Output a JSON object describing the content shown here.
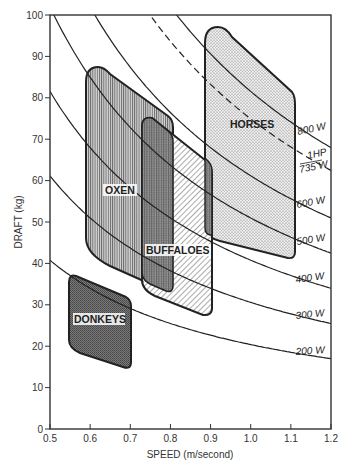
{
  "chart_data": {
    "type": "line",
    "title": "",
    "xlabel": "SPEED (m/second)",
    "ylabel": "DRAFT (kg)",
    "xlim": [
      0.5,
      1.2
    ],
    "ylim": [
      0,
      100
    ],
    "x_ticks": [
      "0.5",
      "0.6",
      "0.7",
      "0.8",
      "0.9",
      "1.0",
      "1.1",
      "1.2"
    ],
    "y_ticks": [
      "0",
      "10",
      "20",
      "30",
      "40",
      "50",
      "60",
      "70",
      "80",
      "90",
      "100"
    ],
    "grid": false,
    "power_curves": [
      {
        "name": "200 W",
        "watts": 200,
        "style": "solid"
      },
      {
        "name": "300 W",
        "watts": 300,
        "style": "solid"
      },
      {
        "name": "400 W",
        "watts": 400,
        "style": "solid"
      },
      {
        "name": "500 W",
        "watts": 500,
        "style": "solid"
      },
      {
        "name": "600 W",
        "watts": 600,
        "style": "solid"
      },
      {
        "name": "1HP / 735 W",
        "watts": 735,
        "style": "dashed"
      },
      {
        "name": "800 W",
        "watts": 800,
        "style": "solid"
      }
    ],
    "regions": [
      {
        "name": "DONKEYS",
        "speed_range": [
          0.55,
          0.71
        ],
        "draft_range": [
          15,
          37
        ],
        "pattern": "dark-stipple"
      },
      {
        "name": "OXEN",
        "speed_range": [
          0.59,
          0.81
        ],
        "draft_range": [
          34,
          87
        ],
        "pattern": "vertical-lines"
      },
      {
        "name": "BUFFALOES",
        "speed_range": [
          0.73,
          0.91
        ],
        "draft_range": [
          28,
          75
        ],
        "pattern": "diagonal-lines"
      },
      {
        "name": "HORSES",
        "speed_range": [
          0.89,
          1.11
        ],
        "draft_range": [
          42,
          97
        ],
        "pattern": "light-stipple"
      }
    ]
  },
  "labels": {
    "xlabel": "SPEED (m/second)",
    "ylabel": "DRAFT (kg)",
    "curve_200": "200 W",
    "curve_300": "300 W",
    "curve_400": "400 W",
    "curve_500": "500 W",
    "curve_600": "600 W",
    "curve_hp_top": "1HP",
    "curve_hp_bottom": "735 W",
    "curve_800": "800 W",
    "donkeys": "DONKEYS",
    "oxen": "OXEN",
    "buffaloes": "BUFFALOES",
    "horses": "HORSES"
  },
  "x_ticks": [
    "0.5",
    "0.6",
    "0.7",
    "0.8",
    "0.9",
    "1.0",
    "1.1",
    "1.2"
  ],
  "y_ticks": [
    "0",
    "10",
    "20",
    "30",
    "40",
    "50",
    "60",
    "70",
    "80",
    "90",
    "100"
  ]
}
